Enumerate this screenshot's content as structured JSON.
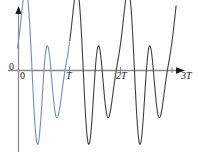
{
  "figure": {
    "title": "",
    "background_color": "#ffffff",
    "width": 198,
    "height": 156
  },
  "axes": {
    "x_axis_name": "time-axis",
    "y_axis_name": "amplitude-axis",
    "origin_label": "0",
    "y_axis_zero_label": "0",
    "tick_labels": [
      "T",
      "2T",
      "3T"
    ],
    "axis_color": "#808080",
    "arrow_color": "#1a1a1a"
  },
  "chart_data": {
    "type": "line",
    "title": "",
    "xlabel": "",
    "ylabel": "",
    "xlim": [
      0,
      3.12
    ],
    "ylim": [
      -1.75,
      1.2
    ],
    "grid": false,
    "legend": false,
    "x_tick_values": [
      0,
      1,
      2,
      3
    ],
    "x_tick_labels": [
      "0",
      "T",
      "2T",
      "3T"
    ],
    "y_tick_values": [
      0
    ],
    "y_tick_labels": [
      "0"
    ],
    "series": [
      {
        "name": "first-period-blue",
        "color": "#6a8fc4",
        "x_range": [
          -0.02,
          1.0
        ]
      },
      {
        "name": "later-periods-dark",
        "color": "#3a3a3a",
        "x_range": [
          1.0,
          3.08
        ]
      }
    ],
    "waveform": {
      "period": 1,
      "formula_note": "sum of two sinusoids: a*sin(2*pi*x) + b*sin(4*pi*x) style partial sum",
      "peak_x": [
        0.14,
        0.52,
        1.14,
        1.52,
        2.14,
        2.52,
        3.05
      ],
      "peak_y": [
        1.0,
        1.02,
        1.02,
        1.02,
        1.02,
        1.02,
        1.0
      ],
      "shallow_trough_x": [
        0.3,
        1.3,
        2.3
      ],
      "shallow_trough_y": [
        -0.32,
        -0.32,
        -0.32
      ],
      "deep_trough_x": [
        0.72,
        1.72,
        2.72
      ],
      "deep_trough_y": [
        -1.7,
        -1.7,
        -1.7
      ],
      "start_point": [
        0.0,
        0.88
      ]
    }
  }
}
